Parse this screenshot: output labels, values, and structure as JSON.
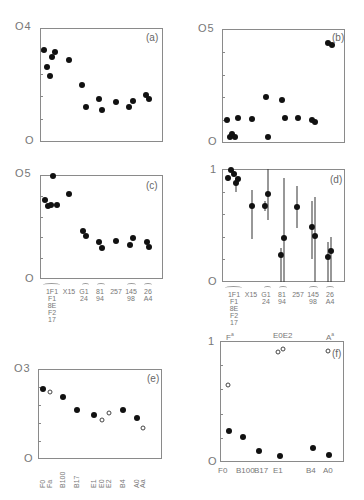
{
  "chart_data": [
    {
      "panel": "a",
      "type": "scatter",
      "title": "(a)",
      "ylim": [
        0,
        0.4
      ],
      "yticks": [
        "0",
        "0.4"
      ],
      "ytick_labels": [
        "0",
        "O4"
      ],
      "frame": {
        "x": 40,
        "y": 28,
        "w": 123,
        "h": 114
      },
      "points": [
        {
          "x": 44,
          "y": 0.323
        },
        {
          "x": 47,
          "y": 0.263
        },
        {
          "x": 50,
          "y": 0.232
        },
        {
          "x": 52,
          "y": 0.298
        },
        {
          "x": 55,
          "y": 0.316
        },
        {
          "x": 69,
          "y": 0.288
        },
        {
          "x": 82,
          "y": 0.2
        },
        {
          "x": 86,
          "y": 0.123
        },
        {
          "x": 99,
          "y": 0.151
        },
        {
          "x": 102,
          "y": 0.112
        },
        {
          "x": 116,
          "y": 0.14
        },
        {
          "x": 129,
          "y": 0.123
        },
        {
          "x": 133,
          "y": 0.144
        },
        {
          "x": 146,
          "y": 0.165
        },
        {
          "x": 149,
          "y": 0.151
        }
      ]
    },
    {
      "panel": "b",
      "type": "scatter",
      "title": "(b)",
      "ylim": [
        0,
        0.5
      ],
      "ytick_labels": [
        "0",
        "O5"
      ],
      "frame": {
        "x": 222,
        "y": 29,
        "w": 123,
        "h": 114
      },
      "points": [
        {
          "x": 227,
          "y": 0.1
        },
        {
          "x": 230,
          "y": 0.025
        },
        {
          "x": 232,
          "y": 0.04
        },
        {
          "x": 235,
          "y": 0.025
        },
        {
          "x": 238,
          "y": 0.11
        },
        {
          "x": 252,
          "y": 0.105
        },
        {
          "x": 266,
          "y": 0.2
        },
        {
          "x": 268,
          "y": 0.025
        },
        {
          "x": 282,
          "y": 0.19
        },
        {
          "x": 285,
          "y": 0.11
        },
        {
          "x": 298,
          "y": 0.11
        },
        {
          "x": 312,
          "y": 0.1
        },
        {
          "x": 315,
          "y": 0.09
        },
        {
          "x": 328,
          "y": 0.44
        },
        {
          "x": 332,
          "y": 0.43
        }
      ]
    },
    {
      "panel": "c",
      "type": "scatter",
      "title": "(c)",
      "ylim": [
        0,
        0.5
      ],
      "ytick_labels": [
        "0",
        "O5"
      ],
      "frame": {
        "x": 40,
        "y": 175,
        "w": 123,
        "h": 104
      },
      "categories": [
        "1F1 F1 8E F2 17",
        "X15",
        "G1 24",
        "81 94",
        "257",
        "145 98",
        "26 A4"
      ],
      "points": [
        {
          "x": 45,
          "y": 0.38
        },
        {
          "x": 48,
          "y": 0.35
        },
        {
          "x": 51,
          "y": 0.355
        },
        {
          "x": 53,
          "y": 0.495
        },
        {
          "x": 57,
          "y": 0.355
        },
        {
          "x": 69,
          "y": 0.41
        },
        {
          "x": 83,
          "y": 0.23
        },
        {
          "x": 86,
          "y": 0.205
        },
        {
          "x": 99,
          "y": 0.18
        },
        {
          "x": 102,
          "y": 0.15
        },
        {
          "x": 116,
          "y": 0.185
        },
        {
          "x": 130,
          "y": 0.165
        },
        {
          "x": 133,
          "y": 0.195
        },
        {
          "x": 147,
          "y": 0.18
        },
        {
          "x": 149,
          "y": 0.155
        }
      ]
    },
    {
      "panel": "d",
      "type": "scatter",
      "title": "(d)",
      "ylim": [
        0,
        1
      ],
      "ytick_labels": [
        "0",
        "1"
      ],
      "frame": {
        "x": 222,
        "y": 169,
        "w": 123,
        "h": 113
      },
      "categories": [
        "1F1 F1 8E F2 17",
        "X15",
        "G1 24",
        "81 94",
        "257",
        "145 98",
        "26 A4"
      ],
      "points": [
        {
          "x": 228,
          "y": 0.92,
          "lo": 0.89,
          "hi": 0.95
        },
        {
          "x": 231,
          "y": 0.99,
          "lo": 0.97,
          "hi": 1.0
        },
        {
          "x": 234,
          "y": 0.96,
          "lo": 0.94,
          "hi": 0.98
        },
        {
          "x": 236,
          "y": 0.88,
          "lo": 0.8,
          "hi": 0.92
        },
        {
          "x": 238,
          "y": 0.91,
          "lo": 0.89,
          "hi": 0.93
        },
        {
          "x": 252,
          "y": 0.67,
          "lo": 0.38,
          "hi": 0.81
        },
        {
          "x": 265,
          "y": 0.67,
          "lo": 0.63,
          "hi": 0.72
        },
        {
          "x": 268,
          "y": 0.78,
          "lo": 0.55,
          "hi": 1.0
        },
        {
          "x": 281,
          "y": 0.24,
          "lo": 0.0,
          "hi": 0.3
        },
        {
          "x": 284,
          "y": 0.39,
          "lo": 0.0,
          "hi": 0.92
        },
        {
          "x": 297,
          "y": 0.66,
          "lo": 0.48,
          "hi": 0.85
        },
        {
          "x": 312,
          "y": 0.49,
          "lo": 0.2,
          "hi": 0.72
        },
        {
          "x": 315,
          "y": 0.41,
          "lo": 0.0,
          "hi": 0.75
        },
        {
          "x": 328,
          "y": 0.22,
          "lo": 0.0,
          "hi": 0.35
        },
        {
          "x": 331,
          "y": 0.27,
          "lo": 0.0,
          "hi": 0.4
        }
      ]
    },
    {
      "panel": "e",
      "type": "scatter",
      "title": "(e)",
      "ylim": [
        0,
        0.3
      ],
      "ytick_labels": [
        "0",
        "O3"
      ],
      "frame": {
        "x": 38,
        "y": 369,
        "w": 124,
        "h": 90
      },
      "categories": [
        "F0",
        "Fa",
        "B100",
        "B17",
        "E1",
        "E0",
        "E2",
        "B4",
        "A0",
        "Aa"
      ],
      "points": [
        {
          "x": 43,
          "y": 0.233,
          "open": false
        },
        {
          "x": 50,
          "y": 0.223,
          "open": true
        },
        {
          "x": 63,
          "y": 0.207,
          "open": false
        },
        {
          "x": 77,
          "y": 0.163,
          "open": false
        },
        {
          "x": 94,
          "y": 0.147,
          "open": false
        },
        {
          "x": 102,
          "y": 0.13,
          "open": true
        },
        {
          "x": 109,
          "y": 0.153,
          "open": true
        },
        {
          "x": 123,
          "y": 0.163,
          "open": false
        },
        {
          "x": 137,
          "y": 0.137,
          "open": false
        },
        {
          "x": 143,
          "y": 0.103,
          "open": true
        }
      ]
    },
    {
      "panel": "f",
      "type": "scatter",
      "title": "(f)",
      "ylim": [
        0,
        1
      ],
      "ytick_labels": [
        "0",
        "1"
      ],
      "frame": {
        "x": 220,
        "y": 341,
        "w": 124,
        "h": 121
      },
      "categories": [
        "F0",
        "B100",
        "B17",
        "E1",
        "B4",
        "A0"
      ],
      "top_labels": [
        "Fa",
        "E0E2",
        "Aa"
      ],
      "points": [
        {
          "x": 228,
          "y": 0.64,
          "open": true
        },
        {
          "x": 278,
          "y": 0.91,
          "open": true
        },
        {
          "x": 283,
          "y": 0.93,
          "open": true
        },
        {
          "x": 328,
          "y": 0.92,
          "open": true
        },
        {
          "x": 229,
          "y": 0.26,
          "open": false
        },
        {
          "x": 243,
          "y": 0.21,
          "open": false
        },
        {
          "x": 259,
          "y": 0.09,
          "open": false
        },
        {
          "x": 280,
          "y": 0.05,
          "open": false
        },
        {
          "x": 313,
          "y": 0.115,
          "open": false
        },
        {
          "x": 329,
          "y": 0.058,
          "open": false
        }
      ]
    }
  ],
  "labels": {
    "a": {
      "title": "(a)",
      "ytop": "O4",
      "ybot": "O"
    },
    "b": {
      "title": "(b)",
      "ytop": "O5",
      "ybot": "O"
    },
    "c": {
      "title": "(c)",
      "ytop": "O5",
      "ybot": "O"
    },
    "d": {
      "title": "(d)",
      "ytop": "1",
      "ybot": "O"
    },
    "e": {
      "title": "(e)",
      "ytop": "O3",
      "ybot": "O"
    },
    "f": {
      "title": "(f)",
      "ytop": "1",
      "ybot": "O"
    },
    "cd_x": [
      "1F1\nF1\n8E\nF2\n17",
      "X15",
      "G1\n24",
      "81\n94",
      "257",
      "145\n98",
      "26\nA4"
    ],
    "e_x": [
      "F0",
      "Fa",
      "B100",
      "B17",
      "E1",
      "E0",
      "E2",
      "B4",
      "A0",
      "Aa"
    ],
    "f_x": [
      "F0",
      "B100",
      "B17",
      "E1",
      "B4",
      "A0"
    ],
    "f_top": [
      "F",
      "E0E2",
      "A"
    ],
    "f_top_sup": "a"
  }
}
